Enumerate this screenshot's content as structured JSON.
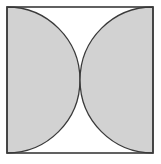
{
  "figure": {
    "canvas": {
      "width": 161,
      "height": 164,
      "background_color": "#ffffff"
    },
    "frame": {
      "shape": "square",
      "x": 7,
      "y": 7,
      "width": 146,
      "height": 146,
      "stroke_color": "#3a3a3a",
      "stroke_width": 1.6,
      "fill_color": "#ffffff"
    },
    "regions": [
      {
        "name": "left-half-disk",
        "shape": "semicircle",
        "diameter_edge": "left",
        "center_x": 7,
        "center_y": 80,
        "radius": 73,
        "bulge_direction": "right",
        "fill_color": "#d2d2d2",
        "stroke_color": "#3a3a3a",
        "stroke_width": 1.3
      },
      {
        "name": "right-half-disk",
        "shape": "semicircle",
        "diameter_edge": "right",
        "center_x": 153,
        "center_y": 80,
        "radius": 73,
        "bulge_direction": "left",
        "fill_color": "#d2d2d2",
        "stroke_color": "#3a3a3a",
        "stroke_width": 1.3
      }
    ],
    "unshaded_regions": [
      {
        "name": "top-lens",
        "description": "white curved triangle between the two arcs above the tangent point",
        "fill_color": "#ffffff"
      },
      {
        "name": "bottom-lens",
        "description": "white curved triangle between the two arcs below the tangent point",
        "fill_color": "#ffffff"
      }
    ],
    "tangent_point": {
      "name": "center-tangent-point",
      "x": 80,
      "y": 80
    },
    "labels": []
  }
}
